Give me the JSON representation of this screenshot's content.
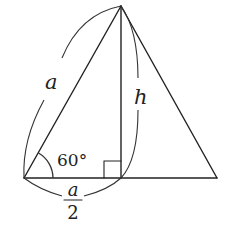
{
  "diagram": {
    "type": "equilateral-triangle-height",
    "colors": {
      "stroke": "#222222",
      "background": "#ffffff"
    },
    "points": {
      "apex": [
        121,
        6
      ],
      "bottom_left": [
        24,
        178
      ],
      "foot": [
        121,
        178
      ],
      "bottom_right": [
        217,
        178
      ]
    },
    "labels": {
      "side": "a",
      "height": "h",
      "angle": "60°",
      "half_base_numerator": "a",
      "half_base_denominator": "2"
    },
    "annotations": {
      "right_angle_marker": true,
      "angle_vertex": "bottom_left"
    }
  }
}
